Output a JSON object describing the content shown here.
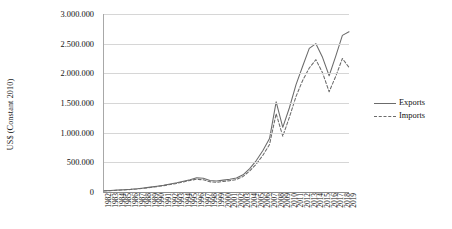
{
  "chart_data": {
    "type": "line",
    "title": "",
    "xlabel": "",
    "ylabel": "US$ (Constant 2010)",
    "ylim": [
      0,
      3000000
    ],
    "ytick_values": [
      0,
      500000,
      1000000,
      1500000,
      2000000,
      2500000,
      3000000
    ],
    "ytick_labels": [
      "0",
      "500.000",
      "1.000.000",
      "1.500.000",
      "2.000.000",
      "2.500.000",
      "3.000.000"
    ],
    "grid": true,
    "legend_position": "right-outside",
    "x": [
      1982,
      1983,
      1984,
      1985,
      1986,
      1987,
      1988,
      1989,
      1990,
      1991,
      1992,
      1993,
      1994,
      1995,
      1996,
      1997,
      1998,
      1999,
      2000,
      2001,
      2002,
      2003,
      2004,
      2005,
      2006,
      2007,
      2008,
      2009,
      2010,
      2011,
      2012,
      2013,
      2014,
      2015,
      2016,
      2017,
      2018,
      2019
    ],
    "categories": [
      "1982",
      "1983",
      "1984",
      "1985",
      "1986",
      "1987",
      "1988",
      "1989",
      "1990",
      "1991",
      "1992",
      "1993",
      "1994",
      "1995",
      "1996",
      "1997",
      "1998",
      "1999",
      "2000",
      "2001",
      "2002",
      "2003",
      "2004",
      "2005",
      "2006",
      "2007",
      "2008",
      "2009",
      "2010",
      "2011",
      "2012",
      "2013",
      "2014",
      "2015",
      "2016",
      "2017",
      "2018",
      "2019"
    ],
    "series": [
      {
        "name": "Exports",
        "style": "solid",
        "color": "#6b6b6b",
        "values": [
          20000,
          25000,
          32000,
          38000,
          45000,
          55000,
          68000,
          82000,
          98000,
          115000,
          135000,
          155000,
          180000,
          205000,
          240000,
          230000,
          195000,
          185000,
          200000,
          215000,
          235000,
          290000,
          395000,
          530000,
          700000,
          900000,
          1520000,
          1090000,
          1420000,
          1810000,
          2120000,
          2420000,
          2500000,
          2270000,
          1960000,
          2290000,
          2640000,
          2700000
        ]
      },
      {
        "name": "Imports",
        "style": "dashed",
        "color": "#6b6b6b",
        "values": [
          18000,
          23000,
          29000,
          35000,
          42000,
          51000,
          63000,
          76000,
          91000,
          107000,
          126000,
          146000,
          170000,
          195000,
          215000,
          205000,
          172000,
          162000,
          178000,
          192000,
          210000,
          262000,
          355000,
          470000,
          620000,
          800000,
          1320000,
          940000,
          1260000,
          1610000,
          1880000,
          2090000,
          2230000,
          2010000,
          1690000,
          1950000,
          2250000,
          2100000
        ]
      }
    ]
  },
  "legend": {
    "items": [
      {
        "label": "Exports"
      },
      {
        "label": "Imports"
      }
    ]
  }
}
